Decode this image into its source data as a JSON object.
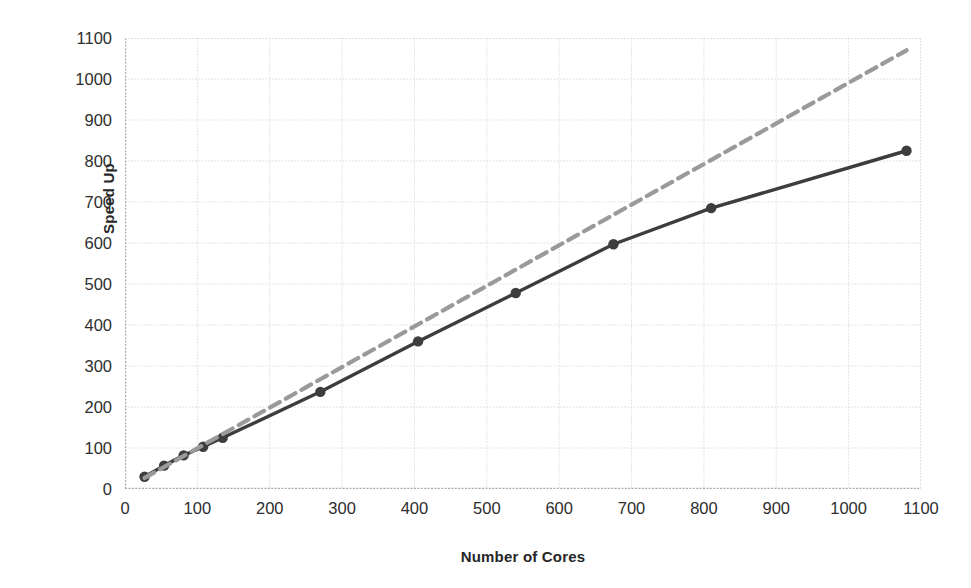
{
  "chart_data": {
    "type": "line",
    "title": "",
    "xlabel": "Number of Cores",
    "ylabel": "Speed Up",
    "xlim": [
      0,
      1100
    ],
    "ylim": [
      0,
      1100
    ],
    "xticks": [
      0,
      100,
      200,
      300,
      400,
      500,
      600,
      700,
      800,
      900,
      1000,
      1100
    ],
    "yticks": [
      0,
      100,
      200,
      300,
      400,
      500,
      600,
      700,
      800,
      900,
      1000,
      1100
    ],
    "grid": true,
    "legend": "none",
    "series": [
      {
        "name": "Measured Speed Up",
        "style": "solid",
        "color": "#3d3d3d",
        "markers": true,
        "x": [
          27,
          54,
          81,
          108,
          135,
          270,
          405,
          540,
          675,
          810,
          1080
        ],
        "y": [
          30,
          57,
          82,
          103,
          125,
          237,
          360,
          478,
          597,
          685,
          825
        ]
      },
      {
        "name": "Ideal Linear Speed Up",
        "style": "dashed",
        "color": "#9a9a9a",
        "markers": false,
        "x": [
          27,
          1080
        ],
        "y": [
          27,
          1070
        ]
      }
    ]
  },
  "axes": {
    "y_title": "Speed Up",
    "x_title": "Number of Cores",
    "y_tick_labels": [
      "1100",
      "1000",
      "900",
      "800",
      "700",
      "600",
      "500",
      "400",
      "300",
      "200",
      "100",
      "0"
    ],
    "x_tick_labels": [
      "0",
      "100",
      "200",
      "300",
      "400",
      "500",
      "600",
      "700",
      "800",
      "900",
      "1000",
      "1100"
    ]
  },
  "colors": {
    "solid_line": "#3d3d3d",
    "dashed_line": "#9a9a9a",
    "grid": "#dcdcdc",
    "axis": "#a8a8a8",
    "text": "#2e2e2e",
    "background": "#ffffff"
  }
}
